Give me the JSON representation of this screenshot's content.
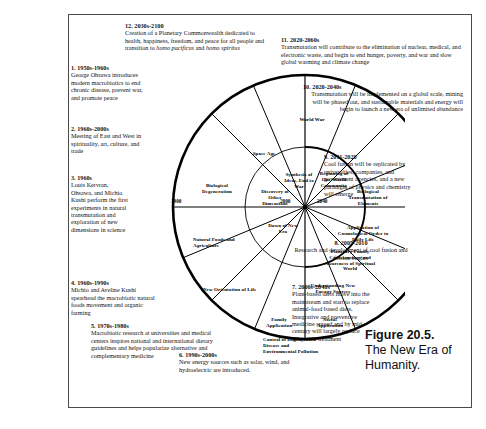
{
  "figure": {
    "number": "Figure 20.5.",
    "caption": "The New Era of Humanity."
  },
  "diagram": {
    "title": "The New Era of Humanity",
    "type": "radial-timeline-wheel",
    "year_markers": [
      "1900",
      "2000",
      "2040"
    ],
    "outer_ring_segments": [
      "World War",
      "Space Age",
      "Biological Degeneration",
      "Natural Foods and Agriculture",
      "New Orientation of Life",
      "Family Application",
      "Social Application",
      "Understanding New Energy Sources",
      "Planetary Family Consciousness and Awareness of Spiritual World",
      "Application of Cosmological Order to Daily Life",
      "Biological Transmutation of Elements",
      "Beginning of One World Community",
      "Synthesis of Ideas, End to War",
      "Discovery of Other Dimensions",
      "Dawn of New Era"
    ],
    "inner_ring_segments": [
      "Discovery of Other Dimensions",
      "Dawn of New Era",
      "Synthesis of Ideas, End to War",
      "Beginning of One World Community",
      "Biological Transmutation of Elements",
      "Application of Cosmological Order to Daily Life",
      "Planetary Family Consciousness and Awareness of Spiritual World",
      "Understanding New Energy Sources",
      "Social Application",
      "Family Application",
      "Control of Degenerative Disease and Environmental Pollution"
    ]
  },
  "notes": [
    {
      "id": 1,
      "number": "1.",
      "period": "1950s-1960s",
      "text": "George Ohsawa introduces modern macrobiotics to end chronic disease, prevent war, and promote peace"
    },
    {
      "id": 2,
      "number": "2.",
      "period": "1960s-2000s",
      "text": "Meeting of East and West in spirituality, art, culture, and trade"
    },
    {
      "id": 3,
      "number": "3.",
      "period": "1960s",
      "text": "Louis Kervran, Ohsawa, and Michio Kushi perform the first experiments in natural transmutation and exploration of new dimensions in science"
    },
    {
      "id": 4,
      "number": "4.",
      "period": "1960s-1990s",
      "text": "Michio and Aveline Kushi spearhead the macrobiotic natural foods movement and organic farming"
    },
    {
      "id": 5,
      "number": "5.",
      "period": "1970s-1980s",
      "text": "Macrobiotic research at universities and medical centers inspires national and international dietary guidelines and helps popularize alternative and complementary medicine"
    },
    {
      "id": 6,
      "number": "6.",
      "period": "1990s-2000s",
      "text": "New energy sources such as solar, wind, and hydroelectric are introduced."
    },
    {
      "id": 7,
      "number": "7.",
      "period": "2000s-2040s",
      "text": "Plant-based diets move into the mainstream and start to replace animal-food based diets. Integrative and preventive medicine spread and by mid century will largely replace allopathic treatment"
    },
    {
      "id": 8,
      "number": "8.",
      "period": "2005-2010",
      "text": "Research and development of cool fusion and fission begins"
    },
    {
      "id": 9,
      "number": "9.",
      "period": "2011-2020",
      "text": "Cool fusion will be replicated by universities, companies, and government agencies, and a new paradigm of physics and chemistry will emerge"
    },
    {
      "id": 10,
      "number": "10.",
      "period": "2020-2040s",
      "text": "Transmutation will be implemented on a global scale, mining will be phased out, and sustainable materials and energy will begin to launch a new era of unlimited abundance"
    },
    {
      "id": 11,
      "number": "11.",
      "period": "2020-2060s",
      "text": "Transmutation will contribute to the elimination of nuclear, medical, and electronic waste, and begin to end hunger, poverty, and war and slow global warming and climate change"
    },
    {
      "id": 12,
      "number": "12.",
      "period": "2030s-2100",
      "text": "Creation of a Planetary Commonwealth dedicated to health, happiness, freedom, and peace for all people and transition to ",
      "italic1": "homo pacificus",
      "joiner": " and ",
      "italic2": "homo spiritus"
    }
  ]
}
